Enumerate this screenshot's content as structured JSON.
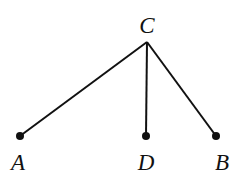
{
  "diagram": {
    "points": {
      "C": {
        "label": "C",
        "x": 147,
        "y": 42,
        "lx": 147,
        "ly": 33
      },
      "A": {
        "label": "A",
        "x": 20,
        "y": 136,
        "lx": 18,
        "ly": 170
      },
      "D": {
        "label": "D",
        "x": 146,
        "y": 136,
        "lx": 146,
        "ly": 170
      },
      "B": {
        "label": "B",
        "x": 216,
        "y": 136,
        "lx": 222,
        "ly": 170
      }
    },
    "segments": [
      [
        "C",
        "A"
      ],
      [
        "C",
        "D"
      ],
      [
        "C",
        "B"
      ]
    ],
    "dots": [
      "A",
      "D",
      "B"
    ],
    "line_color": "#111111"
  }
}
